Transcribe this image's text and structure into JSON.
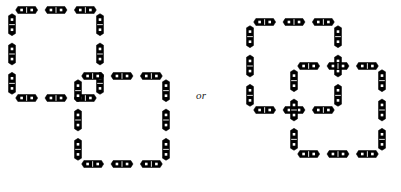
{
  "page": {
    "background": "#ffffff",
    "width": 401,
    "height": 192
  },
  "connector": {
    "label": "or",
    "style": "italic",
    "x": 196,
    "y": 89
  },
  "tile_style": {
    "body_color": "#000000",
    "pip_color": "#ffffff",
    "outline_color": "#000000",
    "tile_length": 22,
    "tile_width": 7,
    "pip_count_per_tile": 2,
    "end_shape": "pointed"
  },
  "figures": [
    {
      "name": "left-figure",
      "caption": "",
      "origin": {
        "x": 12,
        "y": 10
      },
      "description": "Two overlapping square loops of dominoes",
      "loops": [
        {
          "name": "upper-left-loop",
          "x": 0,
          "y": 0,
          "w": 88,
          "h": 88,
          "tiles_per_side": 3
        },
        {
          "name": "lower-right-loop",
          "x": 66,
          "y": 66,
          "w": 88,
          "h": 88,
          "tiles_per_side": 3
        }
      ]
    },
    {
      "name": "right-figure",
      "caption": "",
      "origin": {
        "x": 250,
        "y": 22
      },
      "description": "Two overlapping square loops of dominoes, mirrored offset",
      "loops": [
        {
          "name": "upper-left-loop",
          "x": 0,
          "y": 0,
          "w": 88,
          "h": 88,
          "tiles_per_side": 3
        },
        {
          "name": "lower-right-loop",
          "x": 44,
          "y": 44,
          "w": 88,
          "h": 88,
          "tiles_per_side": 3
        }
      ]
    }
  ]
}
